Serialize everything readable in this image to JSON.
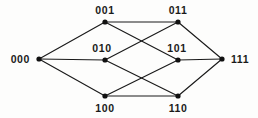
{
  "figure": {
    "type": "hasse-diagram",
    "title": "",
    "background_color": "#fdfdfc",
    "edge_color": "#1a1a1a",
    "node_color": "#111111",
    "label_color": "#1a1a1a"
  },
  "graph_data": {
    "type": "diagram",
    "description": "Hasse diagram of the 3-dimensional Boolean lattice (3-cube) on binary strings 000 through 111",
    "nodes": [
      {
        "id": "000",
        "label": "000",
        "x": 39,
        "y": 59,
        "rank": 0,
        "label_x": 30,
        "label_y": 63,
        "label_anchor": "end"
      },
      {
        "id": "001",
        "label": "001",
        "x": 105,
        "y": 22,
        "rank": 1,
        "label_x": 105,
        "label_y": 14,
        "label_anchor": "middle"
      },
      {
        "id": "010",
        "label": "010",
        "x": 105,
        "y": 60,
        "rank": 1,
        "label_x": 102,
        "label_y": 52,
        "label_anchor": "middle"
      },
      {
        "id": "100",
        "label": "100",
        "x": 105,
        "y": 96,
        "rank": 1,
        "label_x": 105,
        "label_y": 112,
        "label_anchor": "middle"
      },
      {
        "id": "011",
        "label": "011",
        "x": 178,
        "y": 22,
        "rank": 2,
        "label_x": 178,
        "label_y": 14,
        "label_anchor": "middle"
      },
      {
        "id": "101",
        "label": "101",
        "x": 178,
        "y": 60,
        "rank": 2,
        "label_x": 177,
        "label_y": 52,
        "label_anchor": "middle"
      },
      {
        "id": "110",
        "label": "110",
        "x": 178,
        "y": 96,
        "rank": 2,
        "label_x": 178,
        "label_y": 112,
        "label_anchor": "middle"
      },
      {
        "id": "111",
        "label": "111",
        "x": 222,
        "y": 59,
        "rank": 3,
        "label_x": 231,
        "label_y": 63,
        "label_anchor": "start"
      }
    ],
    "edges": [
      {
        "from": "000",
        "to": "001"
      },
      {
        "from": "000",
        "to": "010"
      },
      {
        "from": "000",
        "to": "100"
      },
      {
        "from": "001",
        "to": "011"
      },
      {
        "from": "001",
        "to": "101"
      },
      {
        "from": "010",
        "to": "011"
      },
      {
        "from": "010",
        "to": "110"
      },
      {
        "from": "100",
        "to": "101"
      },
      {
        "from": "100",
        "to": "110"
      },
      {
        "from": "011",
        "to": "111"
      },
      {
        "from": "101",
        "to": "111"
      },
      {
        "from": "110",
        "to": "111"
      }
    ],
    "node_radius": 2.6
  }
}
